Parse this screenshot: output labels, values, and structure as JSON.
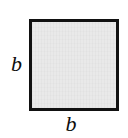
{
  "figure": {
    "name": "square-with-side-labels",
    "background_color": "#ffffff"
  },
  "shape": {
    "type": "square",
    "fill_color": "#e9e9e9",
    "stroke_color": "#111111",
    "stroke_width_px": 3
  },
  "labels": {
    "left": "b",
    "bottom": "b"
  },
  "chart_data": {
    "type": "diagram",
    "shape": "square",
    "side_labels": [
      "b",
      "b"
    ],
    "title": "",
    "annotations": [
      {
        "position": "left",
        "text": "b"
      },
      {
        "position": "bottom",
        "text": "b"
      }
    ]
  }
}
